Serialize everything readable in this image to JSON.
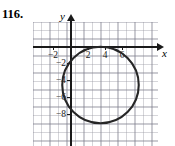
{
  "problem": {
    "number": "116."
  },
  "axes": {
    "x_label": "x",
    "y_label": "y",
    "x_ticks": [
      {
        "value": -2,
        "label": "−2"
      },
      {
        "value": 2,
        "label": "2"
      },
      {
        "value": 4,
        "label": "4"
      },
      {
        "value": 6,
        "label": "6"
      }
    ],
    "y_ticks": [
      {
        "value": -2,
        "label": "−2"
      },
      {
        "value": -4,
        "label": "−4"
      },
      {
        "value": -6,
        "label": "−6"
      },
      {
        "value": -8,
        "label": "−8"
      }
    ]
  },
  "colors": {
    "curve": "#262626",
    "axis": "#1a1a1a",
    "grid_minor": "rgba(150,150,160,0.40)",
    "grid_major": "rgba(120,120,135,0.55)",
    "background": "#ffffff"
  },
  "chart_data": {
    "type": "line",
    "title": "",
    "subtitle": "",
    "xlabel": "x",
    "ylabel": "y",
    "xlim": [
      -4.3,
      10.4
    ],
    "ylim": [
      -14.6,
      2.8
    ],
    "grid": true,
    "legend": null,
    "annotations": [],
    "shapes": [
      {
        "kind": "circle",
        "center_x": 3.5,
        "center_y": -4.5,
        "radius": 4.5,
        "equation": "(x - 3.5)^2 + (y + 4.5)^2 = 4.5^2",
        "x_range": [
          -1.0,
          8.0
        ],
        "y_range": [
          -9.0,
          0.0
        ]
      }
    ],
    "x_tick_values": [
      -2,
      2,
      4,
      6
    ],
    "x_tick_labels": [
      "−2",
      "2",
      "4",
      "6"
    ],
    "y_tick_values": [
      -2,
      -4,
      -6,
      -8
    ],
    "y_tick_labels": [
      "−2",
      "−4",
      "−6",
      "−8"
    ]
  }
}
